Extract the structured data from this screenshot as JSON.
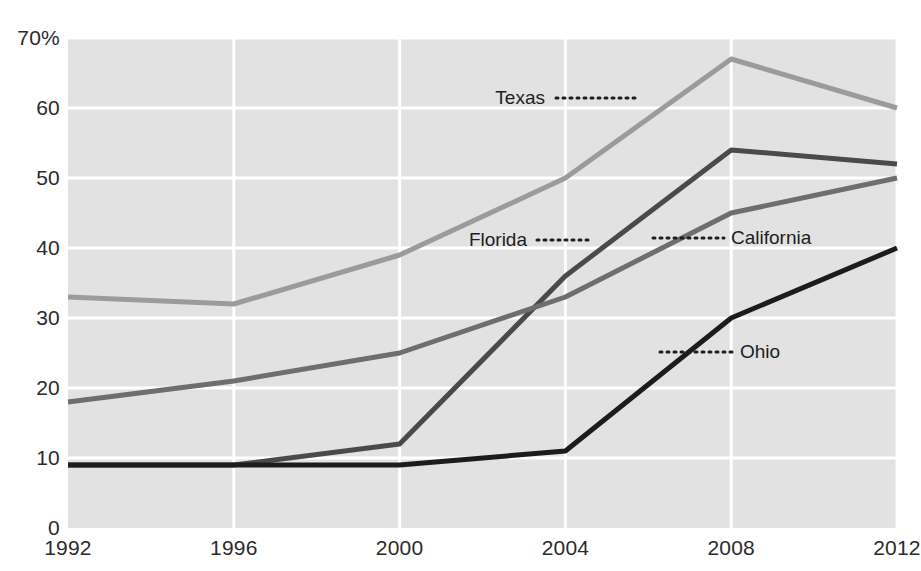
{
  "chart_data": {
    "type": "line",
    "title": "",
    "subtitle": "",
    "xlabel": "",
    "ylabel": "",
    "x": [
      1992,
      1996,
      2000,
      2004,
      2008,
      2012
    ],
    "categories": [
      "1992",
      "1996",
      "2000",
      "2004",
      "2008",
      "2012"
    ],
    "xlim": [
      1992,
      2012
    ],
    "ylim": [
      0,
      70
    ],
    "y_ticks": [
      0,
      10,
      20,
      30,
      40,
      50,
      60,
      70
    ],
    "y_tick_labels": [
      "0",
      "10",
      "20",
      "30",
      "40",
      "50",
      "60",
      "70%"
    ],
    "grid": true,
    "legend_position": "inline-labels",
    "plot_background": "#e2e2e2",
    "grid_color": "#ffffff",
    "series": [
      {
        "name": "Texas",
        "color": "#9b9b9b",
        "values": [
          33,
          32,
          39,
          50,
          67,
          60
        ],
        "label": {
          "text": "Texas",
          "text_x": 545,
          "text_y": 98,
          "leader_x1": 556,
          "leader_x2": 640,
          "leader_y": 98,
          "anchor": "end"
        }
      },
      {
        "name": "Florida",
        "color": "#4a4a4a",
        "values": [
          9,
          9,
          12,
          36,
          54,
          52
        ],
        "label": {
          "text": "Florida",
          "text_x": 527,
          "text_y": 240,
          "leader_x1": 537,
          "leader_x2": 590,
          "leader_y": 240,
          "anchor": "end"
        }
      },
      {
        "name": "California",
        "color": "#6e6e6e",
        "values": [
          18,
          21,
          25,
          33,
          45,
          50
        ],
        "label": {
          "text": "California",
          "text_x": 731,
          "text_y": 238,
          "leader_x1": 653,
          "leader_x2": 724,
          "leader_y": 238,
          "anchor": "start"
        }
      },
      {
        "name": "Ohio",
        "color": "#1c1c1c",
        "values": [
          9,
          9,
          9,
          11,
          30,
          40
        ],
        "label": {
          "text": "Ohio",
          "text_x": 740,
          "text_y": 352,
          "leader_x1": 660,
          "leader_x2": 733,
          "leader_y": 352,
          "anchor": "start"
        }
      }
    ]
  },
  "axis": {
    "y_labels": [
      {
        "text": "70%",
        "value": 70
      },
      {
        "text": "60",
        "value": 60
      },
      {
        "text": "50",
        "value": 50
      },
      {
        "text": "40",
        "value": 40
      },
      {
        "text": "30",
        "value": 30
      },
      {
        "text": "20",
        "value": 20
      },
      {
        "text": "10",
        "value": 10
      },
      {
        "text": "0",
        "value": 0
      }
    ],
    "x_labels": [
      {
        "text": "1992",
        "value": 1992
      },
      {
        "text": "1996",
        "value": 1996
      },
      {
        "text": "2000",
        "value": 2000
      },
      {
        "text": "2004",
        "value": 2004
      },
      {
        "text": "2008",
        "value": 2008
      },
      {
        "text": "2012",
        "value": 2012
      }
    ]
  }
}
